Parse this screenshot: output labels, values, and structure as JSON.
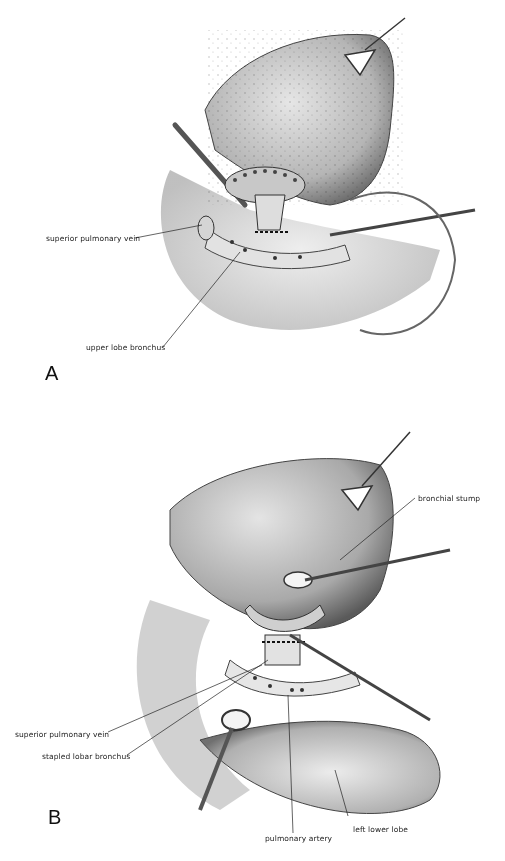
{
  "figure": {
    "panels": [
      {
        "id": "A",
        "letter": "A",
        "labels": {
          "superior_pulmonary_vein": "superior pulmonary vein",
          "upper_lobe_bronchus": "upper lobe bronchus"
        }
      },
      {
        "id": "B",
        "letter": "B",
        "labels": {
          "bronchial_stump": "bronchial stump",
          "superior_pulmonary_vein": "superior pulmonary vein",
          "stapled_lobar_bronchus": "stapled lobar bronchus",
          "pulmonary_artery": "pulmonary artery",
          "left_lower_lobe": "left lower lobe"
        }
      }
    ],
    "colors": {
      "background": "#ffffff",
      "ink": "#222222",
      "tissue_light": "#d8d8d8",
      "tissue_mid": "#a8a8a8",
      "tissue_dark": "#555555"
    }
  }
}
